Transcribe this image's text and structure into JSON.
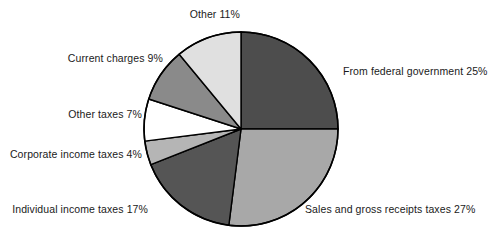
{
  "chart_data": {
    "type": "pie",
    "title": "",
    "subtitle": "",
    "xlabel": "",
    "ylabel": "",
    "grid": false,
    "legend_position": "outside-labels",
    "start_angle_deg": 0,
    "direction": "clockwise",
    "units": "percent",
    "categories": [
      "From federal government",
      "Sales and gross receipts taxes",
      "Individual income taxes",
      "Corporate income taxes",
      "Other taxes",
      "Current charges",
      "Other"
    ],
    "values": [
      25,
      27,
      17,
      4,
      7,
      9,
      11
    ],
    "colors": [
      "#4d4d4d",
      "#a8a8a8",
      "#555555",
      "#b5b5b5",
      "#ffffff",
      "#8a8a8a",
      "#e0e0e0"
    ],
    "slices": [
      {
        "label": "From federal government",
        "value": 25,
        "value_text": "25%",
        "text": "From federal government 25%",
        "color": "#4d4d4d"
      },
      {
        "label": "Sales and gross receipts taxes",
        "value": 27,
        "value_text": "27%",
        "text": "Sales and gross receipts taxes 27%",
        "color": "#a8a8a8"
      },
      {
        "label": "Individual income taxes",
        "value": 17,
        "value_text": "17%",
        "text": "Individual income taxes 17%",
        "color": "#555555"
      },
      {
        "label": "Corporate income taxes",
        "value": 4,
        "value_text": "4%",
        "text": "Corporate income taxes 4%",
        "color": "#b5b5b5"
      },
      {
        "label": "Other taxes",
        "value": 7,
        "value_text": "7%",
        "text": "Other taxes 7%",
        "color": "#ffffff"
      },
      {
        "label": "Current charges",
        "value": 9,
        "value_text": "9%",
        "text": "Current charges 9%",
        "color": "#8a8a8a"
      },
      {
        "label": "Other",
        "value": 11,
        "value_text": "11%",
        "text": "Other 11%",
        "color": "#e0e0e0"
      }
    ],
    "total": 100
  },
  "labels": {
    "other": "Other 11%",
    "current_charges": "Current charges 9%",
    "other_taxes": "Other taxes 7%",
    "corporate_income_taxes": "Corporate income taxes 4%",
    "individual_income_taxes": "Individual income taxes 17%",
    "sales_gross_receipts": "Sales and gross receipts taxes 27%",
    "federal_government": "From federal government 25%"
  },
  "style": {
    "outline_color": "#000000",
    "background": "#ffffff",
    "text_color": "#1a1a1a"
  }
}
